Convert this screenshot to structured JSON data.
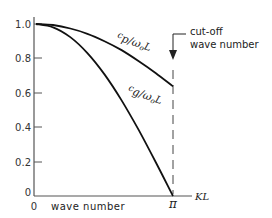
{
  "chart_data": {
    "type": "line",
    "title": "",
    "xlabel": "wave number",
    "x_axis_symbol": "KL",
    "ylabel": "",
    "xlim": [
      0,
      3.14159
    ],
    "ylim": [
      0,
      1.0
    ],
    "grid": false,
    "legend": "none (curves labelled inline)",
    "x_tick_labels": [
      "0",
      "π"
    ],
    "y_tick_labels": [
      "0",
      "0.2",
      "0.4",
      "0.6",
      "0.8",
      "1.0"
    ],
    "x": [
      0,
      0.3927,
      0.7854,
      1.1781,
      1.5708,
      1.9635,
      2.3562,
      2.7489,
      3.14159
    ],
    "series": [
      {
        "name": "cp/ω0L",
        "label": "cp/ω₀L",
        "values": [
          1.0,
          0.994,
          0.974,
          0.943,
          0.9,
          0.848,
          0.784,
          0.714,
          0.637
        ]
      },
      {
        "name": "cg/ω0L",
        "label": "cg/ω₀L",
        "values": [
          1.0,
          0.981,
          0.924,
          0.831,
          0.707,
          0.556,
          0.383,
          0.195,
          0.0
        ]
      }
    ],
    "annotations": [
      {
        "text": "cut-off wave number",
        "at_x": 3.14159,
        "style": "arrow down + dashed vertical line at KL = π"
      }
    ]
  },
  "labels": {
    "y_ticks": [
      "1.0",
      "0.8",
      "0.6",
      "0.4",
      "0.2",
      "0"
    ],
    "x_origin": "0",
    "x_axis_title": "wave number",
    "x_pi": "π",
    "x_symbol": "KL",
    "cp_label_c": "c",
    "cp_label_sub": "p",
    "cp_label_rest": "/ω",
    "cp_label_o": "o",
    "cp_label_L": "L",
    "cg_label_c": "c",
    "cg_label_sub": "g",
    "cg_label_rest": "/ω",
    "cg_label_o": "o",
    "cg_label_L": "L",
    "cutoff_line1": "cut-off",
    "cutoff_line2": "wave number"
  },
  "colors": {
    "axis": "#555555",
    "curve": "#111111",
    "text": "#222222"
  }
}
